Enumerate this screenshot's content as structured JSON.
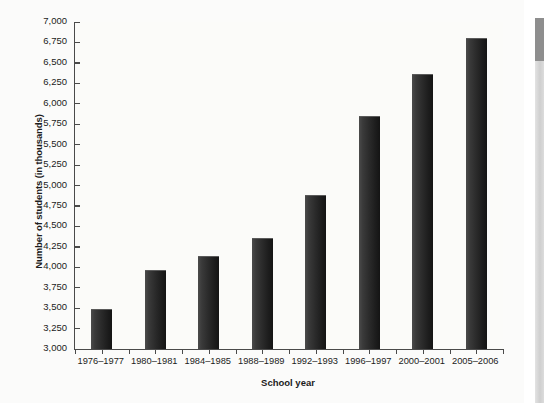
{
  "chart_data": {
    "type": "bar",
    "title": "",
    "xlabel": "School year",
    "ylabel": "Number of students (in thousands)",
    "categories": [
      "1976–1977",
      "1980–1981",
      "1984–1985",
      "1988–1989",
      "1992–1993",
      "1996–1997",
      "2000–2001",
      "2005–2006"
    ],
    "values": [
      3480,
      3950,
      4125,
      4340,
      4870,
      5840,
      6350,
      6790
    ],
    "ylim": [
      3000,
      7000
    ],
    "ytick_values": [
      3000,
      3250,
      3500,
      3750,
      4000,
      4250,
      4500,
      4750,
      5000,
      5250,
      5500,
      5750,
      6000,
      6250,
      6500,
      6750,
      7000
    ],
    "ytick_labels": [
      "3,000",
      "3,250",
      "3,500",
      "3,750",
      "4,000",
      "4,250",
      "4,500",
      "4,750",
      "5,000",
      "5,250",
      "5,500",
      "5,750",
      "6,000",
      "6,250",
      "6,500",
      "6,750",
      "7,000"
    ],
    "grid": false,
    "legend": null,
    "bar_color": "#272727",
    "axis_color": "#4a4a4a",
    "background_color": "#fbfbfa"
  },
  "page_edge": {
    "dark_segment_color": "#8e8e8e",
    "light_segment_color": "#d6d6d6"
  }
}
